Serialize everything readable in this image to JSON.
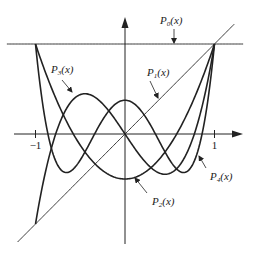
{
  "chart_data": {
    "type": "line",
    "xlabel": "",
    "ylabel": "",
    "xlim": [
      -1,
      1
    ],
    "ylim": [
      -1,
      1
    ],
    "x_ticks": [
      {
        "value": -1,
        "label": "−1"
      },
      {
        "value": 1,
        "label": "1"
      }
    ],
    "grid": false,
    "legend": "annotations with arrows",
    "series": [
      {
        "name": "P0(x)",
        "sub": "0",
        "formula": "1",
        "coeffs": [
          1
        ],
        "x_range": [
          -1.32,
          1.32
        ],
        "stroke_width": 0.9
      },
      {
        "name": "P1(x)",
        "sub": "1",
        "formula": "x",
        "coeffs": [
          0,
          1
        ],
        "x_range": [
          -1.2,
          1.22
        ],
        "stroke_width": 0.9
      },
      {
        "name": "P2(x)",
        "sub": "2",
        "formula": "(3x^2-1)/2",
        "coeffs": [
          -0.5,
          0,
          1.5
        ],
        "x_range": [
          -1,
          1
        ],
        "stroke_width": 1.6
      },
      {
        "name": "P3(x)",
        "sub": "3",
        "formula": "(5x^3-3x)/2",
        "coeffs": [
          0,
          -1.5,
          0,
          2.5
        ],
        "x_range": [
          -1,
          1
        ],
        "stroke_width": 1.6
      },
      {
        "name": "P4(x)",
        "sub": "4",
        "formula": "(35x^4-30x^2+3)/8",
        "coeffs": [
          0.375,
          0,
          -3.75,
          0,
          4.375
        ],
        "x_range": [
          -1,
          1
        ],
        "stroke_width": 1.6
      }
    ],
    "annotations": [
      {
        "series": "P0(x)",
        "sub": "0",
        "text_x": 160,
        "text_y": 24,
        "arrow_from": [
          174,
          29
        ],
        "arrow_to": [
          174,
          43
        ]
      },
      {
        "series": "P1(x)",
        "sub": "1",
        "text_x": 147,
        "text_y": 76,
        "arrow_from": [
          150,
          81
        ],
        "arrow_to": [
          158,
          98
        ]
      },
      {
        "series": "P3(x)",
        "sub": "3",
        "text_x": 51,
        "text_y": 73,
        "arrow_from": [
          62,
          80
        ],
        "arrow_to": [
          72,
          92
        ]
      },
      {
        "series": "P4(x)",
        "sub": "4",
        "text_x": 210,
        "text_y": 180,
        "arrow_from": [
          206,
          168
        ],
        "arrow_to": [
          199,
          156
        ]
      },
      {
        "series": "P2(x)",
        "sub": "2",
        "text_x": 152,
        "text_y": 205,
        "arrow_from": [
          147,
          193
        ],
        "arrow_to": [
          135,
          178
        ]
      }
    ]
  },
  "axes": {
    "origin_px": [
      125,
      134
    ],
    "unit_px": [
      89.5,
      90
    ],
    "x_axis": {
      "from": 14,
      "to": 243
    },
    "y_axis": {
      "from": 244,
      "to": 17
    },
    "color": "#222222"
  }
}
